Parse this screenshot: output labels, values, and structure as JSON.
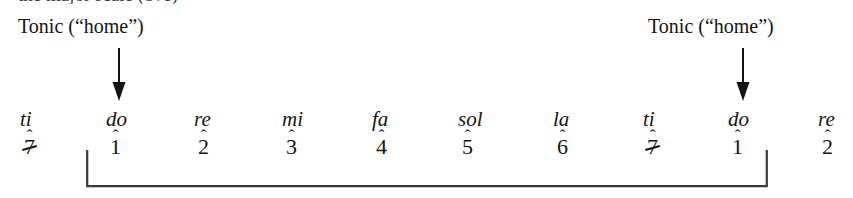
{
  "figure": {
    "background_color": "#ffffff",
    "ink_color": "#141414",
    "clipped_top_line": "the major scale (8ve)"
  },
  "annotations": {
    "tonic_left": {
      "label": "Tonic (“home”)",
      "arrow_icon": "arrow-down-icon",
      "points_to": "do"
    },
    "tonic_right": {
      "label": "Tonic (“home”)",
      "arrow_icon": "arrow-down-icon",
      "points_to": "do"
    }
  },
  "scale": {
    "notes": [
      {
        "syllable": "ti",
        "degree": "7",
        "slashed": true,
        "caret": "ˆ",
        "x": 20,
        "in_bracket": false
      },
      {
        "syllable": "do",
        "degree": "1",
        "slashed": false,
        "caret": "ˆ",
        "x": 106,
        "in_bracket": true
      },
      {
        "syllable": "re",
        "degree": "2",
        "slashed": false,
        "caret": "ˆ",
        "x": 194,
        "in_bracket": true
      },
      {
        "syllable": "mi",
        "degree": "3",
        "slashed": false,
        "caret": "ˆ",
        "x": 282,
        "in_bracket": true
      },
      {
        "syllable": "fa",
        "degree": "4",
        "slashed": false,
        "caret": "ˆ",
        "x": 372,
        "in_bracket": true
      },
      {
        "syllable": "sol",
        "degree": "5",
        "slashed": false,
        "caret": "ˆ",
        "x": 458,
        "in_bracket": true
      },
      {
        "syllable": "la",
        "degree": "6",
        "slashed": false,
        "caret": "ˆ",
        "x": 553,
        "in_bracket": true
      },
      {
        "syllable": "ti",
        "degree": "7",
        "slashed": true,
        "caret": "ˆ",
        "x": 643,
        "in_bracket": true
      },
      {
        "syllable": "do",
        "degree": "1",
        "slashed": false,
        "caret": "ˆ",
        "x": 728,
        "in_bracket": true
      },
      {
        "syllable": "re",
        "degree": "2",
        "slashed": false,
        "caret": "ˆ",
        "x": 818,
        "in_bracket": false
      }
    ]
  },
  "bracket": {
    "name": "octave-span-bracket",
    "from_note": "do",
    "to_note": "do"
  }
}
